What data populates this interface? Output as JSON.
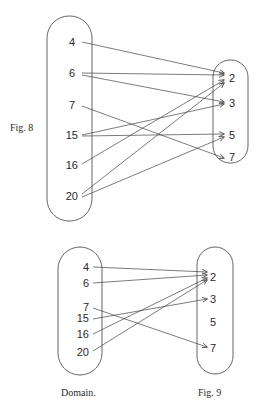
{
  "figures": [
    {
      "caption": "Fig. 8",
      "domain_values": [
        "4",
        "6",
        "7",
        "15",
        "16",
        "20"
      ],
      "codomain_values": [
        "2",
        "3",
        "5",
        "7"
      ],
      "edges": [
        {
          "from": "4",
          "to": "2"
        },
        {
          "from": "6",
          "to": "2"
        },
        {
          "from": "6",
          "to": "3"
        },
        {
          "from": "7",
          "to": "7"
        },
        {
          "from": "15",
          "to": "3"
        },
        {
          "from": "15",
          "to": "5"
        },
        {
          "from": "16",
          "to": "2"
        },
        {
          "from": "20",
          "to": "2"
        },
        {
          "from": "20",
          "to": "5"
        }
      ]
    },
    {
      "caption": "Fig. 9",
      "domain_label": "Domain.",
      "domain_values": [
        "4",
        "6",
        "7",
        "15",
        "16",
        "20"
      ],
      "codomain_values": [
        "2",
        "3",
        "5",
        "7"
      ],
      "edges": [
        {
          "from": "4",
          "to": "2"
        },
        {
          "from": "6",
          "to": "2"
        },
        {
          "from": "7",
          "to": "7"
        },
        {
          "from": "15",
          "to": "3"
        },
        {
          "from": "16",
          "to": "2"
        },
        {
          "from": "20",
          "to": "2"
        }
      ]
    }
  ]
}
